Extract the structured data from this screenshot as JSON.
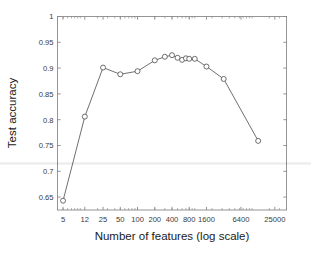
{
  "chart_data": {
    "type": "line",
    "title": "",
    "xlabel": "Number of features (log scale)",
    "ylabel": "Test accuracy",
    "xscale": "log",
    "grid": false,
    "legend": null,
    "xlim": [
      4.0,
      40000
    ],
    "ylim": [
      0.625,
      1.0
    ],
    "xticks": [
      5,
      12,
      25,
      50,
      100,
      200,
      400,
      800,
      1600,
      6400,
      25000
    ],
    "xtick_labels": [
      "5",
      "12",
      "25",
      "50",
      "100",
      "200",
      "400",
      "800",
      "1600",
      "6400",
      "25000"
    ],
    "yticks": [
      0.65,
      0.7,
      0.75,
      0.8,
      0.85,
      0.9,
      0.95,
      1
    ],
    "ytick_labels": [
      "0.65",
      "0.7",
      "0.75",
      "0.8",
      "0.85",
      "0.9",
      "0.95",
      "1"
    ],
    "marker": "circle-open",
    "line_color": "#555555",
    "marker_color": "#555555",
    "x": [
      5,
      12,
      25,
      50,
      100,
      200,
      300,
      400,
      500,
      600,
      700,
      800,
      1000,
      1600,
      3200,
      12800
    ],
    "y": [
      0.643,
      0.806,
      0.901,
      0.888,
      0.894,
      0.915,
      0.922,
      0.925,
      0.92,
      0.916,
      0.919,
      0.918,
      0.918,
      0.903,
      0.879,
      0.759
    ],
    "series": [
      {
        "name": "Test accuracy",
        "x": [
          5,
          12,
          25,
          50,
          100,
          200,
          300,
          400,
          500,
          600,
          700,
          800,
          1000,
          1600,
          3200,
          12800
        ],
        "values": [
          0.643,
          0.806,
          0.901,
          0.888,
          0.894,
          0.915,
          0.922,
          0.925,
          0.92,
          0.916,
          0.919,
          0.918,
          0.918,
          0.903,
          0.879,
          0.759
        ]
      }
    ]
  },
  "axes": {
    "frame_color": "#8a8a8a",
    "tick_label_color": "#3a3a3a",
    "axis_label_color": "#1a1a1a"
  }
}
